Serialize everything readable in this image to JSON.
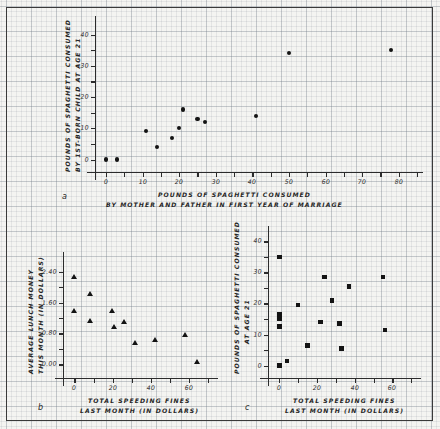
{
  "figure": {
    "background_color": "#f4f4f1",
    "grid_color": "#78828c",
    "ink_color": "#1a1a1a"
  },
  "panels": [
    {
      "letter": "a",
      "marker": "circle",
      "ylabel_line1": "POUNDS OF SPAGHETTI CONSUMED",
      "ylabel_line2": "BY 1ST-BORN CHILD AT AGE 21",
      "xlabel_line1": "POUNDS OF SPAGHETTI CONSUMED",
      "xlabel_line2": "BY MOTHER AND FATHER IN FIRST YEAR OF MARRIAGE",
      "xticks": [
        "0",
        "10",
        "20",
        "30",
        "40",
        "50",
        "60",
        "70",
        "80"
      ],
      "yticks": [
        "0",
        "10",
        "20",
        "30",
        "40"
      ]
    },
    {
      "letter": "b",
      "marker": "triangle",
      "ylabel_line1": "AVERAGE LUNCH MONEY",
      "ylabel_line2": "THIS MONTH (IN DOLLARS)",
      "xlabel_line1": "TOTAL SPEEDING FINES",
      "xlabel_line2": "LAST MONTH (IN DOLLARS)",
      "xticks": [
        "0",
        "20",
        "40",
        "60"
      ],
      "yticks": [
        "0.00",
        "0.80",
        "1.60",
        "2.40"
      ]
    },
    {
      "letter": "c",
      "marker": "square",
      "ylabel_line1": "POUNDS OF SPAGHETTI CONSUMED",
      "ylabel_line2": "AT AGE 21",
      "xlabel_line1": "TOTAL SPEEDING FINES",
      "xlabel_line2": "LAST MONTH (IN DOLLARS)",
      "xticks": [
        "0",
        "20",
        "40",
        "60"
      ],
      "yticks": [
        "0",
        "10",
        "20",
        "30",
        "40"
      ]
    }
  ],
  "chart_data": [
    {
      "type": "scatter",
      "panel": "a",
      "title": "",
      "xlabel": "POUNDS OF SPAGHETTI CONSUMED BY MOTHER AND FATHER IN FIRST YEAR OF MARRIAGE",
      "ylabel": "POUNDS OF SPAGHETTI CONSUMED BY 1ST-BORN CHILD AT AGE 21",
      "xlim": [
        -3,
        85
      ],
      "ylim": [
        -4,
        44
      ],
      "xticks": [
        0,
        10,
        20,
        30,
        40,
        50,
        60,
        70,
        80
      ],
      "yticks": [
        0,
        10,
        20,
        30,
        40
      ],
      "grid": true,
      "marker": "circle",
      "points": [
        {
          "x": 0,
          "y": 0
        },
        {
          "x": 3,
          "y": 0
        },
        {
          "x": 11,
          "y": 9
        },
        {
          "x": 14,
          "y": 4
        },
        {
          "x": 18,
          "y": 7
        },
        {
          "x": 20,
          "y": 10
        },
        {
          "x": 21,
          "y": 16
        },
        {
          "x": 25,
          "y": 13
        },
        {
          "x": 27,
          "y": 12
        },
        {
          "x": 41,
          "y": 14
        },
        {
          "x": 50,
          "y": 34
        },
        {
          "x": 78,
          "y": 35
        }
      ]
    },
    {
      "type": "scatter",
      "panel": "b",
      "title": "",
      "xlabel": "TOTAL SPEEDING FINES LAST MONTH (IN DOLLARS)",
      "ylabel": "AVERAGE LUNCH MONEY THIS MONTH (IN DOLLARS)",
      "xlim": [
        -6,
        72
      ],
      "ylim": [
        -0.35,
        2.75
      ],
      "xticks": [
        0,
        20,
        40,
        60
      ],
      "yticks": [
        0.0,
        0.8,
        1.6,
        2.4
      ],
      "grid": true,
      "marker": "triangle",
      "points": [
        {
          "x": 0,
          "y": 2.25
        },
        {
          "x": 0,
          "y": 1.38
        },
        {
          "x": 8,
          "y": 1.82
        },
        {
          "x": 8,
          "y": 1.1
        },
        {
          "x": 20,
          "y": 1.37
        },
        {
          "x": 21,
          "y": 0.96
        },
        {
          "x": 26,
          "y": 1.08
        },
        {
          "x": 32,
          "y": 0.55
        },
        {
          "x": 42,
          "y": 0.63
        },
        {
          "x": 58,
          "y": 0.74
        },
        {
          "x": 64,
          "y": 0.06
        }
      ]
    },
    {
      "type": "scatter",
      "panel": "c",
      "title": "",
      "xlabel": "TOTAL SPEEDING FINES LAST MONTH (IN DOLLARS)",
      "ylabel": "POUNDS OF SPAGHETTI CONSUMED AT AGE 21",
      "xlim": [
        -6,
        72
      ],
      "ylim": [
        -4,
        43
      ],
      "xticks": [
        0,
        20,
        40,
        60
      ],
      "yticks": [
        0,
        10,
        20,
        30,
        40
      ],
      "grid": true,
      "marker": "square",
      "points": [
        {
          "x": 0,
          "y": 0
        },
        {
          "x": 0,
          "y": 12.5
        },
        {
          "x": 0,
          "y": 15
        },
        {
          "x": 0,
          "y": 16.5
        },
        {
          "x": 0,
          "y": 35
        },
        {
          "x": 4,
          "y": 1.5
        },
        {
          "x": 10,
          "y": 19.5
        },
        {
          "x": 15,
          "y": 6.5
        },
        {
          "x": 22,
          "y": 14
        },
        {
          "x": 24,
          "y": 28.5
        },
        {
          "x": 28,
          "y": 21
        },
        {
          "x": 32,
          "y": 13.5
        },
        {
          "x": 33,
          "y": 5.5
        },
        {
          "x": 37,
          "y": 25.5
        },
        {
          "x": 55,
          "y": 28.5
        },
        {
          "x": 56,
          "y": 11.5
        }
      ]
    }
  ]
}
